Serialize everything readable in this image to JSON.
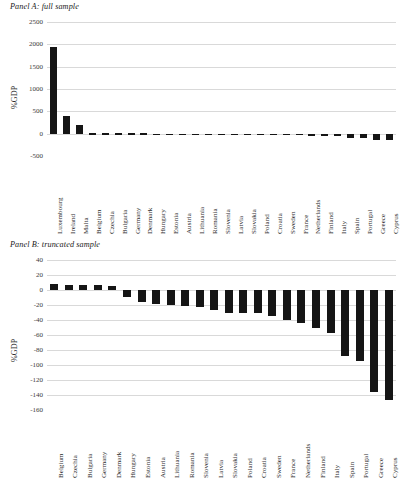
{
  "figure": {
    "panels": [
      {
        "id": "panel-a",
        "title": "Panel A: full sample"
      },
      {
        "id": "panel-b",
        "title": "Panel B: truncated sample"
      }
    ]
  },
  "chart_data": [
    {
      "type": "bar",
      "title": "Panel A: full sample",
      "xlabel": "",
      "ylabel": "%GDP",
      "ylim": [
        -500,
        2500
      ],
      "yticks": [
        2500,
        2000,
        1500,
        1000,
        500,
        0,
        -500
      ],
      "ytick_labels": [
        "2500",
        "2000",
        "1500",
        "1000",
        "500",
        "0",
        "-500"
      ],
      "grid": true,
      "legend": "none",
      "categories": [
        "Luxembourg",
        "Ireland",
        "Malta",
        "Belgium",
        "Czechia",
        "Bulgaria",
        "Germany",
        "Denmark",
        "Hungary",
        "Estonia",
        "Austria",
        "Lithuania",
        "Romania",
        "Slovenia",
        "Latvia",
        "Slovakia",
        "Poland",
        "Croatia",
        "Sweden",
        "France",
        "Netherlands",
        "Finland",
        "Italy",
        "Spain",
        "Portugal",
        "Greece",
        "Cyprus"
      ],
      "values": [
        1950,
        400,
        195,
        8,
        7,
        7,
        7,
        5,
        -6,
        -9,
        -13,
        -16,
        -19,
        -20,
        -26,
        -30,
        -31,
        -31,
        -34,
        -40,
        -44,
        -50,
        -57,
        -88,
        -94,
        -136,
        -146
      ]
    },
    {
      "type": "bar",
      "title": "Panel B: truncated sample",
      "xlabel": "",
      "ylabel": "%GDP",
      "ylim": [
        -160,
        40
      ],
      "yticks": [
        40,
        20,
        0,
        -20,
        -40,
        -60,
        -80,
        -100,
        -120,
        -140,
        -160
      ],
      "ytick_labels": [
        "40",
        "20",
        "0",
        "-20",
        "-40",
        "-60",
        "-80",
        "-100",
        "-120",
        "-140",
        "-160"
      ],
      "grid": true,
      "legend": "none",
      "categories": [
        "Belgium",
        "Czechia",
        "Bulgaria",
        "Germany",
        "Denmark",
        "Hungary",
        "Estonia",
        "Austria",
        "Lithuania",
        "Romania",
        "Slovenia",
        "Latvia",
        "Slovakia",
        "Poland",
        "Croatia",
        "Sweden",
        "France",
        "Netherlands",
        "Finland",
        "Italy",
        "Spain",
        "Portugal",
        "Greece",
        "Cyprus"
      ],
      "values": [
        8,
        7,
        7,
        7,
        5,
        -9,
        -16,
        -19,
        -20,
        -21,
        -23,
        -26,
        -30,
        -31,
        -31,
        -34,
        -40,
        -44,
        -50,
        -57,
        -88,
        -94,
        -136,
        -146
      ]
    }
  ]
}
